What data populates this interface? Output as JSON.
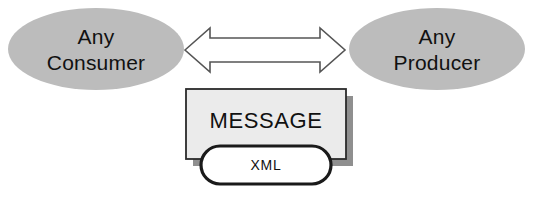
{
  "diagram": {
    "background_color": "#ffffff",
    "nodes": {
      "consumer": {
        "name": "consumer-ellipse",
        "line1": "Any",
        "line2": "Consumer",
        "shape": "ellipse",
        "fill_color": "#bcbcbc",
        "text_color": "#111111"
      },
      "producer": {
        "name": "producer-ellipse",
        "line1": "Any",
        "line2": "Producer",
        "shape": "ellipse",
        "fill_color": "#bcbcbc",
        "text_color": "#111111"
      },
      "message": {
        "name": "message-box",
        "label": "MESSAGE",
        "shape": "rectangle",
        "fill_color": "#ebebeb",
        "border_color": "#2b2b2b",
        "shadow_color": "#8f8f8f",
        "text_color": "#111111"
      },
      "xml": {
        "name": "xml-capsule",
        "label": "XML",
        "shape": "rounded-rectangle",
        "fill_color": "#ffffff",
        "border_color": "#1a1a1a",
        "text_color": "#111111"
      }
    },
    "connector": {
      "name": "bidirectional-arrow",
      "shape": "double-headed-arrow",
      "direction": "bidirectional",
      "fill_color": "#ffffff",
      "border_color": "#555555"
    }
  }
}
